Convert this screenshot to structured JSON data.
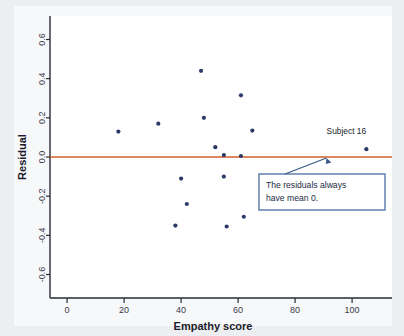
{
  "chart_data": {
    "type": "scatter",
    "title": "",
    "xlabel": "Empathy score",
    "ylabel": "Residual",
    "xlim": [
      -6,
      114
    ],
    "ylim": [
      -0.72,
      0.72
    ],
    "xticks": [
      0,
      20,
      40,
      60,
      80,
      100
    ],
    "yticks": [
      0.6,
      0.4,
      0.2,
      0.0,
      -0.2,
      -0.4,
      -0.6
    ],
    "xtick_labels": [
      "0",
      "20",
      "40",
      "60",
      "80",
      "100"
    ],
    "ytick_labels": [
      "0.6",
      "0.4",
      "0.2",
      "0.0",
      "-0.2",
      "-0.4",
      "-0.6"
    ],
    "grid": false,
    "legend": false,
    "reference_line": {
      "y": 0.0,
      "color": "#d2602a",
      "label": ""
    },
    "marker_color": "#2b3a67",
    "series": [
      {
        "name": "Residuals",
        "points": [
          {
            "x": 18,
            "y": 0.13
          },
          {
            "x": 32,
            "y": 0.17
          },
          {
            "x": 38,
            "y": -0.35
          },
          {
            "x": 40,
            "y": -0.11
          },
          {
            "x": 42,
            "y": -0.24
          },
          {
            "x": 47,
            "y": 0.44
          },
          {
            "x": 48,
            "y": 0.2
          },
          {
            "x": 52,
            "y": 0.05
          },
          {
            "x": 55,
            "y": 0.01
          },
          {
            "x": 55,
            "y": -0.1
          },
          {
            "x": 56,
            "y": -0.355
          },
          {
            "x": 61,
            "y": 0.005
          },
          {
            "x": 61,
            "y": 0.315
          },
          {
            "x": 62,
            "y": -0.305
          },
          {
            "x": 65,
            "y": 0.135
          },
          {
            "x": 105,
            "y": 0.04
          }
        ]
      }
    ],
    "annotations": [
      {
        "name": "subject-16-label",
        "text": "Subject 16",
        "x": 98,
        "y": 0.12
      },
      {
        "name": "mean-zero-callout",
        "text_line_1": "The residuals always",
        "text_line_2": "have mean 0.",
        "border_color": "#4a6fa5",
        "fill_color": "#ffffff",
        "pointer_target_x": 91,
        "pointer_target_y": 0.0
      }
    ]
  }
}
